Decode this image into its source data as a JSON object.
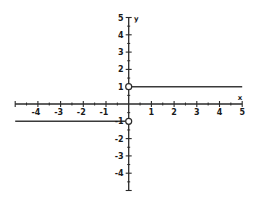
{
  "chart_data": {
    "type": "line",
    "title": "",
    "xlabel": "x",
    "ylabel": "y",
    "xlim": [
      -5,
      5
    ],
    "ylim": [
      -5,
      5
    ],
    "grid": false,
    "legend": null,
    "x_ticks": [
      -4,
      -3,
      -2,
      -1,
      1,
      2,
      3,
      4,
      5
    ],
    "y_ticks": [
      5,
      4,
      3,
      2,
      1,
      -1,
      -2,
      -3,
      -4
    ],
    "minor_tick_step": 0.5,
    "series": [
      {
        "name": "negative branch",
        "x": [
          -5,
          0
        ],
        "y": [
          -1,
          -1
        ],
        "right_endpoint": "open"
      },
      {
        "name": "positive branch",
        "x": [
          0,
          5
        ],
        "y": [
          1,
          1
        ],
        "left_endpoint": "open"
      }
    ],
    "open_points": [
      {
        "x": 0,
        "y": 1
      },
      {
        "x": 0,
        "y": -1
      }
    ]
  },
  "labels": {
    "x_axis": "x",
    "y_axis": "y",
    "x_ticks": [
      "-4",
      "-3",
      "-2",
      "-1",
      "1",
      "2",
      "3",
      "4",
      "5"
    ],
    "y_ticks": [
      "5",
      "4",
      "3",
      "2",
      "1",
      "-1",
      "-2",
      "-3",
      "-4"
    ]
  },
  "colors": {
    "line": "#3a3a3a",
    "axis": "#2a2a2a",
    "background": "#ffffff"
  }
}
